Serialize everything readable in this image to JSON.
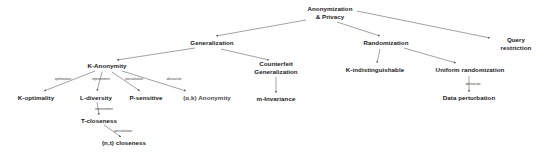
{
  "diagram": {
    "background_color": "#ffffff",
    "node_color": "#1a1a1a",
    "edge_color": "#555555",
    "nodes": [
      {
        "id": "root",
        "label": "Anonymization\n& Privacy",
        "x": 330,
        "y": 13,
        "style": "normal"
      },
      {
        "id": "general",
        "label": "Generalization",
        "x": 212,
        "y": 43,
        "style": "normal"
      },
      {
        "id": "random",
        "label": "Randomization",
        "x": 386,
        "y": 43,
        "style": "normal"
      },
      {
        "id": "query",
        "label": "Query restriction",
        "x": 516,
        "y": 44,
        "style": "normal"
      },
      {
        "id": "kanon",
        "label": "K-Anonymity",
        "x": 107,
        "y": 66,
        "style": "normal"
      },
      {
        "id": "counterfeit",
        "label": "Counterfeit\nGeneralization",
        "x": 276,
        "y": 68,
        "style": "normal"
      },
      {
        "id": "kindist",
        "label": "K-indistinguishable",
        "x": 375,
        "y": 70,
        "style": "normal"
      },
      {
        "id": "unirandom",
        "label": "Uniform randomization",
        "x": 470,
        "y": 70,
        "style": "normal"
      },
      {
        "id": "koptimal",
        "label": "K-optimality",
        "x": 36,
        "y": 98,
        "style": "normal"
      },
      {
        "id": "ldiv",
        "label": "L-diversity",
        "x": 96,
        "y": 98,
        "style": "normal"
      },
      {
        "id": "psens",
        "label": "P-sensitive",
        "x": 146,
        "y": 98,
        "style": "normal"
      },
      {
        "id": "akanon",
        "label": "(α,k) Anonymity",
        "x": 207,
        "y": 98,
        "style": "dim"
      },
      {
        "id": "minvar",
        "label": "m-Invariance",
        "x": 276,
        "y": 99,
        "style": "normal"
      },
      {
        "id": "dataperturb",
        "label": "Data perturbation",
        "x": 469,
        "y": 98,
        "style": "normal"
      },
      {
        "id": "tclose",
        "label": "T-closeness",
        "x": 99,
        "y": 121,
        "style": "normal"
      },
      {
        "id": "ntclose",
        "label": "(n,t) closeness",
        "x": 124,
        "y": 143,
        "style": "normal"
      }
    ],
    "edges": [
      {
        "from": "root",
        "to": "general",
        "x1": 306,
        "y1": 20,
        "x2": 216,
        "y2": 36,
        "label": ""
      },
      {
        "from": "root",
        "to": "random",
        "x1": 337,
        "y1": 22,
        "x2": 380,
        "y2": 36,
        "label": ""
      },
      {
        "from": "root",
        "to": "query",
        "x1": 357,
        "y1": 11,
        "x2": 490,
        "y2": 38,
        "label": ""
      },
      {
        "from": "general",
        "to": "kanon",
        "x1": 195,
        "y1": 48,
        "x2": 117,
        "y2": 60,
        "label": ""
      },
      {
        "from": "general",
        "to": "counterfeit",
        "x1": 221,
        "y1": 49,
        "x2": 269,
        "y2": 60,
        "label": ""
      },
      {
        "from": "random",
        "to": "kindist",
        "x1": 380,
        "y1": 49,
        "x2": 377,
        "y2": 63,
        "label": ""
      },
      {
        "from": "random",
        "to": "unirandom",
        "x1": 404,
        "y1": 48,
        "x2": 456,
        "y2": 63,
        "label": ""
      },
      {
        "from": "kanon",
        "to": "koptimal",
        "x1": 95,
        "y1": 71,
        "x2": 44,
        "y2": 91,
        "label": "optimization",
        "lx": 63,
        "ly": 79
      },
      {
        "from": "kanon",
        "to": "ldiv",
        "x1": 102,
        "y1": 72,
        "x2": 97,
        "y2": 91,
        "label": "improvement",
        "lx": 101,
        "ly": 79
      },
      {
        "from": "kanon",
        "to": "psens",
        "x1": 112,
        "y1": 72,
        "x2": 140,
        "y2": 91,
        "label": "specialization",
        "lx": 134,
        "ly": 79
      },
      {
        "from": "kanon",
        "to": "akanon",
        "x1": 122,
        "y1": 71,
        "x2": 186,
        "y2": 91,
        "label": "abstraction",
        "lx": 174,
        "ly": 79
      },
      {
        "from": "counterfeit",
        "to": "minvar",
        "x1": 276,
        "y1": 77,
        "x2": 276,
        "y2": 93,
        "label": ""
      },
      {
        "from": "ldiv",
        "to": "tclose",
        "x1": 97,
        "y1": 102,
        "x2": 99,
        "y2": 115,
        "label": "improvement",
        "lx": 104,
        "ly": 109
      },
      {
        "from": "tclose",
        "to": "ntclose",
        "x1": 104,
        "y1": 125,
        "x2": 121,
        "y2": 137,
        "label": "specialization",
        "lx": 123,
        "ly": 131
      },
      {
        "from": "unirandom",
        "to": "dataperturb",
        "x1": 469,
        "y1": 76,
        "x2": 469,
        "y2": 92,
        "label": "abstraction",
        "lx": 473,
        "ly": 84
      }
    ]
  }
}
